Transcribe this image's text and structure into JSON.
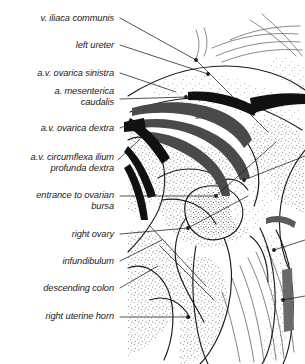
{
  "figure": {
    "kind": "anatomical-line-drawing",
    "style": "stippled pen-and-ink illustration with leader-line labels",
    "background_color": "#ffffff",
    "ink_color": "#1b1b1b",
    "vessel_dark_color": "#4a4a4a",
    "vessel_black_color": "#111111",
    "stipple_color": "#2a2a2a"
  },
  "labels": [
    {
      "id": "v-iliaca-communis",
      "text": "v. iliaca communis",
      "x": 8,
      "y": 13,
      "w": 106,
      "lines": 1
    },
    {
      "id": "left-ureter",
      "text": "left ureter",
      "x": 8,
      "y": 40,
      "w": 106,
      "lines": 1
    },
    {
      "id": "av-ovarica-sinistra",
      "text": "a.v. ovarica sinistra",
      "x": 4,
      "y": 68,
      "w": 110,
      "lines": 1
    },
    {
      "id": "a-mesenterica-caudalis",
      "text": "a. mesenterica\ncaudalis",
      "x": 4,
      "y": 86,
      "w": 110,
      "lines": 2
    },
    {
      "id": "av-ovarica-dextra",
      "text": "a.v. ovarica dextra",
      "x": 4,
      "y": 123,
      "w": 110,
      "lines": 1
    },
    {
      "id": "av-circumflexa-ilium",
      "text": "a.v. circumflexa ilium\nprofunda dextra",
      "x": -1,
      "y": 152,
      "w": 115,
      "lines": 2
    },
    {
      "id": "entrance-to-ovarian-bursa",
      "text": "entrance to ovarian\nbursa",
      "x": 4,
      "y": 190,
      "w": 110,
      "lines": 2
    },
    {
      "id": "right-ovary",
      "text": "right ovary",
      "x": 8,
      "y": 229,
      "w": 106,
      "lines": 1
    },
    {
      "id": "infundibulum",
      "text": "infundibulum",
      "x": 8,
      "y": 256,
      "w": 106,
      "lines": 1
    },
    {
      "id": "descending-colon",
      "text": "descending colon",
      "x": 8,
      "y": 283,
      "w": 106,
      "lines": 1
    },
    {
      "id": "right-uterine-horn",
      "text": "right uterine horn",
      "x": 8,
      "y": 311,
      "w": 106,
      "lines": 1
    }
  ],
  "leaders": [
    {
      "id": "leader-v-iliaca-communis",
      "d": "M120,18 L196,60"
    },
    {
      "id": "leader-left-ureter",
      "d": "M120,45 L208,74"
    },
    {
      "id": "leader-av-ovarica-sinistra",
      "d": "M120,73 L176,92"
    },
    {
      "id": "leader-a-mesenterica-caudalis",
      "d": "M120,99 L186,97"
    },
    {
      "id": "leader-av-ovarica-dextra",
      "d": "M120,128 L135,122"
    },
    {
      "id": "leader-av-circumflexa-ilium",
      "d": "M118,160 L140,139"
    },
    {
      "id": "leader-entrance-ovarian-bursa",
      "d": "M120,196 L216,196"
    },
    {
      "id": "leader-right-ovary",
      "d": "M120,234 L188,228"
    },
    {
      "id": "leader-infundibulum",
      "d": "M120,261 L162,240"
    },
    {
      "id": "leader-descending-colon",
      "d": "M120,288 L158,266"
    },
    {
      "id": "leader-right-uterine-horn",
      "d": "M120,317 L188,317"
    }
  ],
  "leader_endpoints": [
    {
      "id": "dot-v-iliaca-communis",
      "cx": 196,
      "cy": 60
    },
    {
      "id": "dot-left-ureter",
      "cx": 208,
      "cy": 74
    },
    {
      "id": "dot-a-mesenterica-caudalis",
      "cx": 186,
      "cy": 97
    },
    {
      "id": "dot-entrance-ovarian-bursa",
      "cx": 216,
      "cy": 196
    },
    {
      "id": "dot-right-ovary",
      "cx": 188,
      "cy": 228
    },
    {
      "id": "dot-right-uterine-horn",
      "cx": 188,
      "cy": 317
    },
    {
      "id": "dot-lower-right",
      "cx": 283,
      "cy": 300
    },
    {
      "id": "dot-mid-right",
      "cx": 274,
      "cy": 250
    },
    {
      "id": "dot-upper-mid",
      "cx": 244,
      "cy": 180
    }
  ]
}
